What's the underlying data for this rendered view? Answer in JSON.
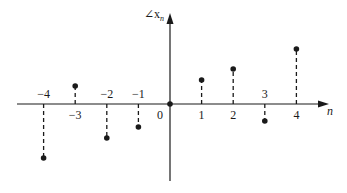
{
  "chart_data": {
    "type": "stem",
    "title": "",
    "xlabel": "n",
    "ylabel": "∠x_n",
    "x": [
      -4,
      -3,
      -2,
      -1,
      0,
      1,
      2,
      3,
      4
    ],
    "values": [
      -54,
      18,
      -34,
      -23,
      0,
      24,
      35,
      -17,
      55
    ],
    "value_units": "relative (arbitrary, odd-symmetric phase)",
    "tick_labels": [
      "−4",
      "−3",
      "−2",
      "−1",
      "0",
      "1",
      "2",
      "3",
      "4"
    ],
    "tick_label_positions": [
      "above",
      "below",
      "above",
      "above",
      "below",
      "below",
      "below",
      "above",
      "below"
    ],
    "grid": false,
    "legend": null,
    "stem_style": "dashed",
    "marker": "filled-circle",
    "colors": {
      "ink": "#1a1a1a",
      "background": "#ffffff"
    }
  },
  "labels": {
    "y_axis": "∠x",
    "y_axis_sub": "n",
    "x_axis": "n"
  }
}
